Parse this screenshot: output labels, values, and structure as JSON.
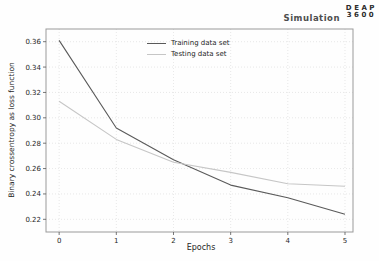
{
  "header": {
    "title": "Simulation",
    "logo_line1": "DEAP",
    "logo_line2": "3600"
  },
  "colors": {
    "grid": "#dedede",
    "spine": "#9a9a9a",
    "tick": "#555555",
    "tick_text": "#262626",
    "title_text": "#4d4d4d",
    "logo_text": "#2b2b2b",
    "background": "#fefefe"
  },
  "chart_data": {
    "type": "line",
    "title": "Simulation",
    "xlabel": "Epochs",
    "ylabel": "Binary crossentropy as loss function",
    "x": [
      0,
      1,
      2,
      3,
      4,
      5
    ],
    "series": [
      {
        "name": "Training data set",
        "color": "#5a5a5a",
        "values": [
          0.361,
          0.292,
          0.267,
          0.247,
          0.237,
          0.224
        ]
      },
      {
        "name": "Testing data set",
        "color": "#c6c6c6",
        "values": [
          0.313,
          0.283,
          0.265,
          0.257,
          0.248,
          0.246
        ]
      }
    ],
    "xlim": [
      -0.23,
      5.14
    ],
    "ylim": [
      0.21,
      0.37
    ],
    "x_ticks": [
      0,
      1,
      2,
      3,
      4,
      5
    ],
    "y_ticks": [
      0.22,
      0.24,
      0.26,
      0.28,
      0.3,
      0.32,
      0.34,
      0.36
    ],
    "grid": true,
    "grid_style": "dotted",
    "legend_position": "upper center"
  }
}
